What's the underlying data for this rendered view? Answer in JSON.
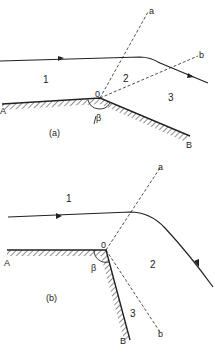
{
  "figure_a": {
    "caption": "(a)",
    "regions": [
      "1",
      "2",
      "3"
    ],
    "vertex": "0",
    "angle": "β",
    "wall_start": "A",
    "wall_end": "B",
    "ray_a": "a",
    "ray_b": "b"
  },
  "figure_b": {
    "caption": "(b)",
    "regions": [
      "1",
      "2",
      "3"
    ],
    "vertex": "0",
    "angle": "β",
    "wall_start": "A",
    "wall_end": "B",
    "ray_a": "a",
    "ray_b": "b"
  },
  "colors": {
    "ink": "#222222",
    "background": "#ffffff"
  }
}
